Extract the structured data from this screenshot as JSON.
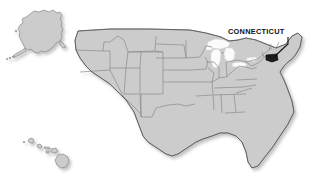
{
  "map": {
    "title": "United States map with Connecticut highlighted",
    "background_color": "#ffffff",
    "state_fill_color": "#cccccc",
    "state_border_color": "#8a8a8a",
    "outline_color": "#5a5a5a",
    "highlight_color": "#1a1a1a",
    "lake_color": "#fbfbfb",
    "shadow_color": "#d7d7d7"
  },
  "callout": {
    "label": "CONNECTICUT",
    "label_color": "#111111",
    "leader_line_color": "#111111",
    "target_state": "Connecticut"
  },
  "insets": [
    {
      "name": "Alaska",
      "position": "top-left"
    },
    {
      "name": "Hawaii",
      "position": "bottom-left"
    }
  ],
  "highlighted_states": [
    {
      "name": "Connecticut",
      "abbr": "CT",
      "fill": "#1a1a1a"
    }
  ]
}
